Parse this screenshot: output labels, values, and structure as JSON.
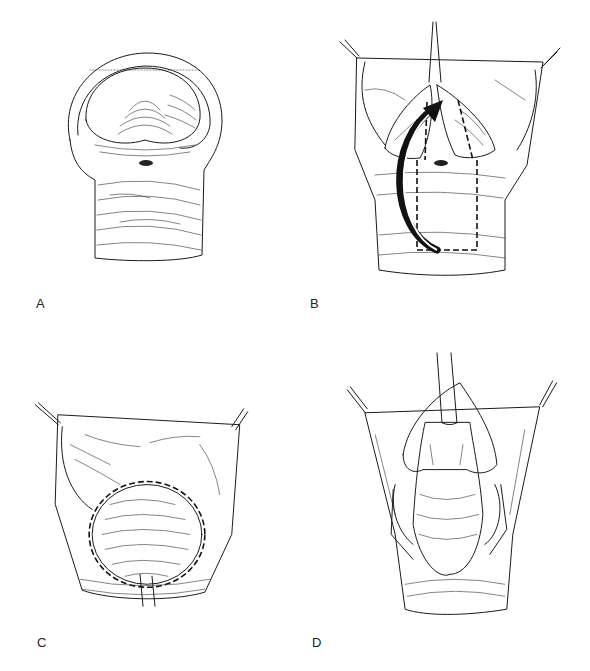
{
  "figure": {
    "panels": [
      {
        "id": "A",
        "label": "A",
        "description": "Trachea end view, circular opening with posterior membrane and small orifice"
      },
      {
        "id": "B",
        "label": "B",
        "description": "Opened airway with stay sutures, dashed rectangular flap outline and curved black arrow indicating flap rotation"
      },
      {
        "id": "C",
        "label": "C",
        "description": "Flap sutured in place with dashed suture line around oval opening and stay sutures"
      },
      {
        "id": "D",
        "label": "D",
        "description": "Completed reconstruction with tube in place and stay sutures"
      }
    ]
  },
  "colors": {
    "background": "#ffffff",
    "line": "#1a1a1a",
    "label": "#222222"
  }
}
